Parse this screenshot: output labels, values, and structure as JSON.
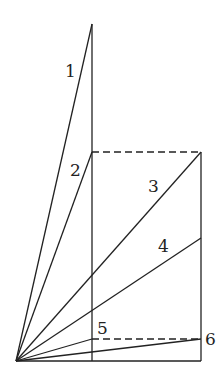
{
  "diagram": {
    "type": "geometric-ray-diagram",
    "origin": {
      "x": 16,
      "y": 361
    },
    "rays": [
      {
        "label": "1",
        "end": {
          "x": 92,
          "y": 24
        }
      },
      {
        "label": "2",
        "end": {
          "x": 92,
          "y": 152
        }
      },
      {
        "label": "3",
        "end": {
          "x": 201,
          "y": 152
        }
      },
      {
        "label": "4",
        "end": {
          "x": 201,
          "y": 238
        }
      },
      {
        "label": "5",
        "end": {
          "x": 92,
          "y": 339
        }
      },
      {
        "label": "6",
        "end": {
          "x": 201,
          "y": 339
        }
      }
    ],
    "labels": {
      "l1": "1",
      "l2": "2",
      "l3": "3",
      "l4": "4",
      "l5": "5",
      "l6": "6"
    }
  }
}
